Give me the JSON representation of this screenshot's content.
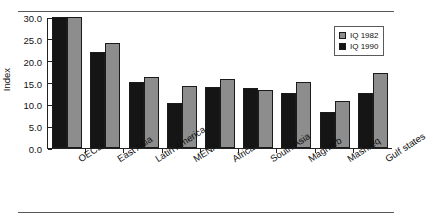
{
  "chart_data": {
    "type": "bar",
    "title": "",
    "xlabel": "",
    "ylabel": "Index",
    "ylim": [
      0,
      30
    ],
    "yticks": [
      "0.0",
      "5.0",
      "10.0",
      "15.0",
      "20.0",
      "25.0",
      "30.0"
    ],
    "ytick_values": [
      0,
      5,
      10,
      15,
      20,
      25,
      30
    ],
    "grid": false,
    "legend_position": "top-right",
    "categories": [
      "OECD",
      "East Asia",
      "Latin America",
      "MENA",
      "Africa",
      "South Asia",
      "Maghreb",
      "Mashreq",
      "Gulf states"
    ],
    "series": [
      {
        "name": "IQ 1990",
        "color": "#151515",
        "values": [
          30.0,
          22.0,
          15.2,
          10.2,
          13.9,
          13.8,
          12.7,
          8.3,
          12.5
        ]
      },
      {
        "name": "IQ 1982",
        "color": "#8d8d8d",
        "values": [
          30.0,
          24.1,
          16.2,
          14.2,
          15.7,
          13.2,
          15.2,
          10.7,
          17.2
        ]
      }
    ]
  },
  "legend": {
    "items": [
      {
        "label": "IQ 1982",
        "swatch": "gray"
      },
      {
        "label": "IQ 1990",
        "swatch": "black"
      }
    ]
  }
}
